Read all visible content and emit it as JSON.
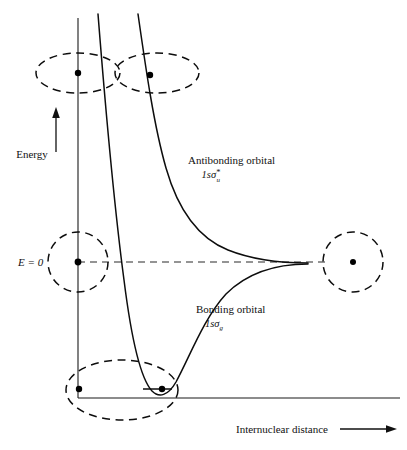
{
  "figure": {
    "axes": {
      "y_axis_label": "Energy",
      "y_axis_arrow": "up-arrow-icon",
      "x_axis_label": "Internuclear distance",
      "x_axis_arrow": "right-arrow-icon",
      "zero_level_label": "E = 0",
      "zero_level_label_parts": {
        "symbol": "E",
        "equals": "=",
        "value": "0"
      }
    },
    "curves": [
      {
        "name": "antibonding",
        "label_line1": "Antibonding orbital",
        "term_prefix": "1s",
        "term_sigma": "σ",
        "term_superscript": "*",
        "term_subscript": "u",
        "label_x": 188,
        "label_y": 164
      },
      {
        "name": "bonding",
        "label_line1": "Bonding orbital",
        "term_prefix": "1s",
        "term_sigma": "σ",
        "term_superscript": "",
        "term_subscript": "g",
        "label_x": 196,
        "label_y": 313
      }
    ],
    "orbitals": [
      {
        "name": "antibonding-orbital-left-lobe",
        "shape": "ellipse",
        "cx": 78,
        "cy": 73,
        "rx": 42,
        "ry": 20
      },
      {
        "name": "antibonding-orbital-right-lobe",
        "shape": "ellipse",
        "cx": 157,
        "cy": 73,
        "rx": 42,
        "ry": 20
      },
      {
        "name": "separated-atom-orbital-left",
        "shape": "circle",
        "cx": 78,
        "cy": 262,
        "rx": 30,
        "ry": 30
      },
      {
        "name": "separated-atom-orbital-right",
        "shape": "circle",
        "cx": 353,
        "cy": 262,
        "rx": 30,
        "ry": 30
      },
      {
        "name": "bonding-orbital-merged",
        "shape": "ellipse",
        "cx": 122,
        "cy": 390,
        "rx": 56,
        "ry": 30
      }
    ],
    "nuclei": [
      {
        "name": "nucleus-top-left",
        "cx": 78,
        "cy": 73
      },
      {
        "name": "nucleus-top-right",
        "cx": 150,
        "cy": 75
      },
      {
        "name": "nucleus-mid-left",
        "cx": 78,
        "cy": 262,
        "radius": 3.4
      },
      {
        "name": "nucleus-mid-right",
        "cx": 353,
        "cy": 262,
        "radius": 3.0
      },
      {
        "name": "nucleus-bottom-left",
        "cx": 79,
        "cy": 389
      },
      {
        "name": "nucleus-bottom-right",
        "cx": 162,
        "cy": 389
      }
    ]
  }
}
